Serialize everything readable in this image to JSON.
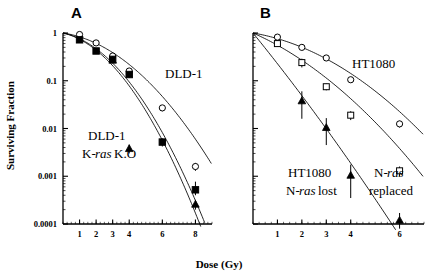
{
  "figure": {
    "axis_title_x": "Dose (Gy)",
    "axis_title_y": "Surviving Fraction",
    "panel_a_label": "A",
    "panel_b_label": "B"
  },
  "yaxis": {
    "ticks": [
      "1",
      "0.1",
      "0.01",
      "0.001",
      "0.0001"
    ],
    "values": [
      1,
      0.1,
      0.01,
      0.001,
      0.0001
    ],
    "min": 0.0001,
    "max": 1
  },
  "panel_a": {
    "xticks": [
      "1",
      "2",
      "3",
      "4",
      "6",
      "8"
    ],
    "xtick_values": [
      1,
      2,
      3,
      4,
      6,
      8
    ],
    "xmin": 0,
    "xmax": 9,
    "annotations": [
      {
        "name": "dld1-label",
        "text": "DLD-1",
        "x": 165,
        "y": 78
      },
      {
        "name": "dld1-ko-line1",
        "text": "DLD-1",
        "x": 88,
        "y": 140
      },
      {
        "name": "dld1-ko-line2-pre",
        "text": "K-",
        "x": 82,
        "y": 158
      },
      {
        "name": "dld1-ko-line2-ital",
        "text": "ras",
        "x": 95,
        "y": 158
      },
      {
        "name": "dld1-ko-line2-post",
        "text": " K.O",
        "x": 114,
        "y": 158
      }
    ]
  },
  "panel_b": {
    "xticks": [
      "1",
      "2",
      "3",
      "4",
      "6"
    ],
    "xtick_values": [
      1,
      2,
      3,
      4,
      6
    ],
    "xmin": 0,
    "xmax": 7,
    "annotations": [
      {
        "name": "ht1080-label",
        "text": "HT1080",
        "x": 352,
        "y": 68
      },
      {
        "name": "ht1080-lost-line1",
        "text": "HT1080",
        "x": 288,
        "y": 177
      },
      {
        "name": "ht1080-lost-line2-pre",
        "text": "N-",
        "x": 286,
        "y": 195
      },
      {
        "name": "ht1080-lost-line2-ital",
        "text": "ras",
        "x": 299,
        "y": 195
      },
      {
        "name": "ht1080-lost-line2-post",
        "text": " lost",
        "x": 318,
        "y": 195
      },
      {
        "name": "nras-replaced-line1-pre",
        "text": "N-",
        "x": 374,
        "y": 177
      },
      {
        "name": "nras-replaced-line1-ital",
        "text": "ras",
        "x": 387,
        "y": 177
      },
      {
        "name": "nras-replaced-line2",
        "text": "replaced",
        "x": 369,
        "y": 195
      }
    ]
  },
  "chart_data": {
    "type": "line",
    "xlabel": "Dose (Gy)",
    "ylabel": "Surviving Fraction",
    "ylim": [
      0.0001,
      1
    ],
    "yscale": "log",
    "grid": false,
    "legend": "inline-annotations",
    "panels": [
      {
        "panel": "A",
        "label": "A",
        "xlim": [
          0,
          9
        ],
        "xticks": [
          1,
          2,
          3,
          4,
          6,
          8
        ],
        "series": [
          {
            "name": "DLD-1",
            "marker": "open-circle",
            "x": [
              1,
              2,
              3,
              4,
              6,
              8
            ],
            "y": [
              0.93,
              0.62,
              0.33,
              0.16,
              0.027,
              0.0016
            ],
            "yerr_lo": [
              0.06,
              0.05,
              0.03,
              0.02,
              0.004,
              0.0003
            ],
            "yerr_hi": [
              0.06,
              0.05,
              0.03,
              0.02,
              0.004,
              0.0003
            ],
            "fit": {
              "alpha": 0.12,
              "beta": 0.065
            }
          },
          {
            "name": "DLD-1 K-ras K.O (squares)",
            "marker": "filled-square",
            "x": [
              1,
              2,
              3,
              4,
              6,
              8
            ],
            "y": [
              0.72,
              0.42,
              0.28,
              0.135,
              0.0052,
              0.00052
            ],
            "yerr_lo": [
              0.09,
              0.05,
              0.03,
              0.02,
              0.001,
              0.00012
            ],
            "yerr_hi": [
              0.09,
              0.05,
              0.03,
              0.02,
              0.001,
              0.00025
            ],
            "fit": {
              "alpha": 0.17,
              "beta": 0.105
            }
          },
          {
            "name": "DLD-1 K-ras K.O (triangles)",
            "marker": "filled-triangle",
            "x": [
              3,
              4,
              8
            ],
            "y": [
              0.27,
              0.0038,
              0.00026
            ],
            "yerr_lo": [
              0.03,
              0.0008,
              6e-05
            ],
            "yerr_hi": [
              0.03,
              0.0008,
              6e-05
            ],
            "fit": {
              "alpha": 0.19,
              "beta": 0.112
            }
          }
        ]
      },
      {
        "panel": "B",
        "label": "B",
        "xlim": [
          0,
          7
        ],
        "xticks": [
          1,
          2,
          3,
          4,
          6
        ],
        "series": [
          {
            "name": "HT1080",
            "marker": "open-circle",
            "x": [
              1,
              2,
              3,
              4,
              6
            ],
            "y": [
              0.82,
              0.5,
              0.3,
              0.105,
              0.0125
            ],
            "yerr_lo": [
              0.07,
              0.05,
              0.03,
              0.012,
              0.002
            ],
            "yerr_hi": [
              0.07,
              0.05,
              0.03,
              0.012,
              0.002
            ],
            "fit": {
              "alpha": 0.2,
              "beta": 0.072
            }
          },
          {
            "name": "N-ras replaced",
            "marker": "open-square",
            "x": [
              1,
              2,
              3,
              4,
              6
            ],
            "y": [
              0.6,
              0.24,
              0.075,
              0.019,
              0.0013
            ],
            "yerr_lo": [
              0.08,
              0.05,
              0.012,
              0.004,
              0.0003
            ],
            "yerr_hi": [
              0.08,
              0.05,
              0.012,
              0.004,
              0.0003
            ],
            "fit": {
              "alpha": 0.52,
              "beta": 0.068
            }
          },
          {
            "name": "HT1080 N-ras lost",
            "marker": "filled-triangle",
            "x": [
              2,
              3,
              4,
              6
            ],
            "y": [
              0.038,
              0.0105,
              0.00105,
              0.00012
            ],
            "yerr_lo": [
              0.022,
              0.006,
              0.0007,
              5e-05
            ],
            "yerr_hi": [
              0.022,
              0.006,
              0.0007,
              5e-05
            ],
            "fit": {
              "alpha": 1.45,
              "beta": 0.03
            }
          }
        ]
      }
    ]
  }
}
